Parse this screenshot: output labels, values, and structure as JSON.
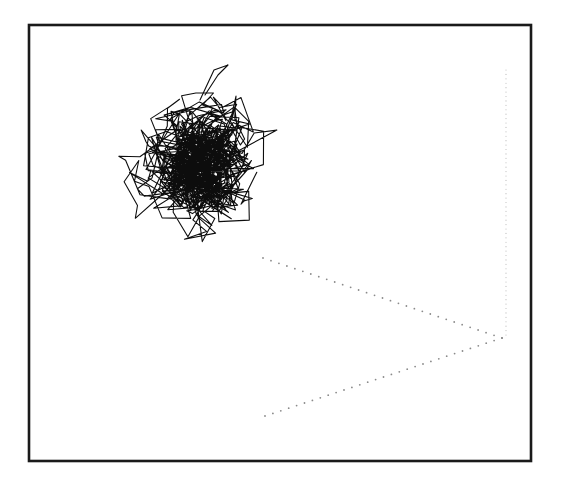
{
  "chart_data": {
    "type": "line",
    "title": "",
    "xlabel": "",
    "ylabel": "",
    "grid": false,
    "legend": null,
    "frame": {
      "x": 29,
      "y": 25,
      "width": 502,
      "height": 436
    },
    "walk": {
      "center": [
        200,
        170
      ],
      "extent_x": [
        108,
        282
      ],
      "extent_y": [
        63,
        243
      ],
      "steps": 900,
      "seed": 7,
      "spike": [
        [
          205,
          95
        ],
        [
          218,
          75
        ],
        [
          228,
          65
        ],
        [
          214,
          70
        ],
        [
          200,
          100
        ]
      ]
    },
    "dotted_guides": [
      {
        "from": [
          263,
          258
        ],
        "to": [
          502,
          338
        ],
        "dots": 30
      },
      {
        "from": [
          265,
          416
        ],
        "to": [
          502,
          338
        ],
        "dots": 30
      },
      {
        "from": [
          506,
          70
        ],
        "to": [
          506,
          335
        ],
        "dots": 60,
        "faint": true
      }
    ],
    "colors": {
      "line": "#0d0d0d",
      "frame": "#1a1a1a",
      "dots": "#8a8a8a",
      "background": "#ffffff"
    }
  }
}
